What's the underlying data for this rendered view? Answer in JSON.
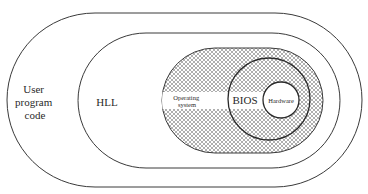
{
  "diagram": {
    "type": "nested-layers",
    "layers": [
      {
        "id": "user-program-code",
        "label_lines": [
          "User",
          "program",
          "code"
        ]
      },
      {
        "id": "hll",
        "label": "HLL"
      },
      {
        "id": "operating-system",
        "label_lines": [
          "Operating",
          "system"
        ],
        "fill": "crosshatch"
      },
      {
        "id": "bios",
        "label": "BIOS"
      },
      {
        "id": "hardware",
        "label": "Hardware"
      }
    ]
  },
  "colors": {
    "stroke": "#3a3a3a",
    "hatch": "#8c8c8c",
    "background": "#ffffff"
  }
}
